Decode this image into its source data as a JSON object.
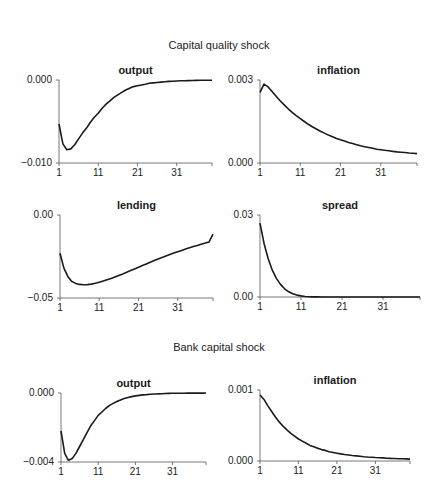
{
  "sections": [
    {
      "title": "Capital quality shock"
    },
    {
      "title": "Bank capital shock"
    }
  ],
  "chart_data": [
    {
      "type": "line",
      "section": "Capital quality shock",
      "title": "output",
      "xlabel": "",
      "ylabel": "",
      "ylim": [
        -0.01,
        0.0
      ],
      "yticks": [
        "0.000",
        "-0.010"
      ],
      "xticks": [
        "1",
        "11",
        "21",
        "31"
      ],
      "grid": false,
      "x_range": [
        1,
        40
      ],
      "values": [
        -0.0053,
        -0.0077,
        -0.0084,
        -0.0083,
        -0.0078,
        -0.0071,
        -0.0064,
        -0.0058,
        -0.0051,
        -0.0045,
        -0.004,
        -0.0034,
        -0.0029,
        -0.0025,
        -0.0021,
        -0.0018,
        -0.0015,
        -0.0012,
        -0.001,
        -0.0008,
        -0.0007,
        -0.0006,
        -0.0005,
        -0.0004,
        -0.00035,
        -0.0003,
        -0.00025,
        -0.0002,
        -0.00017,
        -0.00014,
        -0.00012,
        -0.0001,
        -8e-05,
        -7e-05,
        -6e-05,
        -5e-05,
        -4e-05,
        -3e-05,
        -2e-05,
        -2e-05
      ]
    },
    {
      "type": "line",
      "section": "Capital quality shock",
      "title": "inflation",
      "xlabel": "",
      "ylabel": "",
      "ylim": [
        0.0,
        0.003
      ],
      "yticks": [
        "0.003",
        "0.000"
      ],
      "xticks": [
        "1",
        "11",
        "21",
        "31"
      ],
      "grid": false,
      "x_range": [
        1,
        40
      ],
      "values": [
        0.00255,
        0.00285,
        0.00275,
        0.00258,
        0.00241,
        0.00225,
        0.0021,
        0.00196,
        0.00183,
        0.00171,
        0.0016,
        0.0015,
        0.0014,
        0.00131,
        0.00123,
        0.00115,
        0.00108,
        0.00101,
        0.00095,
        0.00089,
        0.00084,
        0.00079,
        0.00074,
        0.0007,
        0.00066,
        0.00062,
        0.00059,
        0.00056,
        0.00053,
        0.0005,
        0.00048,
        0.00046,
        0.00044,
        0.00042,
        0.0004,
        0.00039,
        0.00038,
        0.00036,
        0.00035,
        0.00034
      ]
    },
    {
      "type": "line",
      "section": "Capital quality shock",
      "title": "lending",
      "xlabel": "",
      "ylabel": "",
      "ylim": [
        -0.05,
        0.0
      ],
      "yticks": [
        "0.00",
        "-0.05"
      ],
      "xticks": [
        "1",
        "11",
        "21",
        "31"
      ],
      "grid": false,
      "x_range": [
        1,
        40
      ],
      "values": [
        -0.023,
        -0.032,
        -0.037,
        -0.04,
        -0.0412,
        -0.0418,
        -0.042,
        -0.0419,
        -0.0416,
        -0.0411,
        -0.0405,
        -0.0398,
        -0.039,
        -0.0382,
        -0.0373,
        -0.0364,
        -0.0355,
        -0.0345,
        -0.0335,
        -0.0325,
        -0.0315,
        -0.0305,
        -0.0295,
        -0.0285,
        -0.0275,
        -0.0265,
        -0.0256,
        -0.0247,
        -0.0238,
        -0.0229,
        -0.0221,
        -0.0213,
        -0.0205,
        -0.0197,
        -0.019,
        -0.0183,
        -0.0176,
        -0.0169,
        -0.0162,
        -0.0115
      ]
    },
    {
      "type": "line",
      "section": "Capital quality shock",
      "title": "spread",
      "xlabel": "",
      "ylabel": "",
      "ylim": [
        0.0,
        0.03
      ],
      "yticks": [
        "0.03",
        "0.00"
      ],
      "xticks": [
        "1",
        "11",
        "21",
        "31"
      ],
      "grid": false,
      "x_range": [
        1,
        40
      ],
      "values": [
        0.027,
        0.0195,
        0.014,
        0.0098,
        0.0068,
        0.0046,
        0.003,
        0.0019,
        0.0012,
        0.0007,
        0.0004,
        0.0002,
        0.0001,
        5e-05,
        2e-05,
        0.0,
        0.0,
        0.0,
        0.0,
        0.0,
        0.0,
        0.0,
        0.0,
        0.0,
        0.0,
        0.0,
        0.0,
        0.0,
        0.0,
        0.0,
        0.0,
        0.0,
        0.0,
        0.0,
        0.0,
        0.0,
        0.0,
        0.0,
        0.0,
        0.0
      ]
    },
    {
      "type": "line",
      "section": "Bank capital shock",
      "title": "output",
      "xlabel": "",
      "ylabel": "",
      "ylim": [
        -0.004,
        0.0
      ],
      "yticks": [
        "0.000",
        "-0.004"
      ],
      "xticks": [
        "1",
        "11",
        "21",
        "31"
      ],
      "grid": false,
      "x_range": [
        1,
        40
      ],
      "values": [
        -0.0022,
        -0.0035,
        -0.0039,
        -0.0038,
        -0.0035,
        -0.0031,
        -0.0027,
        -0.0023,
        -0.0019,
        -0.0016,
        -0.0013,
        -0.0011,
        -0.0009,
        -0.00073,
        -0.0006,
        -0.00049,
        -0.0004,
        -0.00032,
        -0.00026,
        -0.00021,
        -0.00017,
        -0.00014,
        -0.00011,
        -9e-05,
        -7e-05,
        -6e-05,
        -5e-05,
        -4e-05,
        -3e-05,
        -2.5e-05,
        -2e-05,
        -1.5e-05,
        -1e-05,
        -1e-05,
        -8e-06,
        -6e-06,
        -5e-06,
        -4e-06,
        -3e-06,
        -2e-06
      ]
    },
    {
      "type": "line",
      "section": "Bank capital shock",
      "title": "inflation",
      "xlabel": "",
      "ylabel": "",
      "ylim": [
        0.0,
        0.001
      ],
      "yticks": [
        "0.001",
        "0.000"
      ],
      "xticks": [
        "1",
        "11",
        "21",
        "31"
      ],
      "grid": false,
      "x_range": [
        1,
        40
      ],
      "values": [
        0.00093,
        0.00087,
        0.00078,
        0.0007,
        0.00062,
        0.00055,
        0.00049,
        0.00044,
        0.00039,
        0.00035,
        0.00031,
        0.00028,
        0.00025,
        0.00022,
        0.0002,
        0.00018,
        0.00016,
        0.00015,
        0.00013,
        0.00012,
        0.00011,
        0.0001,
        9.2e-05,
        8.5e-05,
        7.8e-05,
        7.2e-05,
        6.6e-05,
        6.1e-05,
        5.7e-05,
        5.3e-05,
        4.9e-05,
        4.6e-05,
        4.3e-05,
        4e-05,
        3.7e-05,
        3.5e-05,
        3.3e-05,
        3.1e-05,
        2.9e-05,
        2.7e-05
      ]
    }
  ]
}
